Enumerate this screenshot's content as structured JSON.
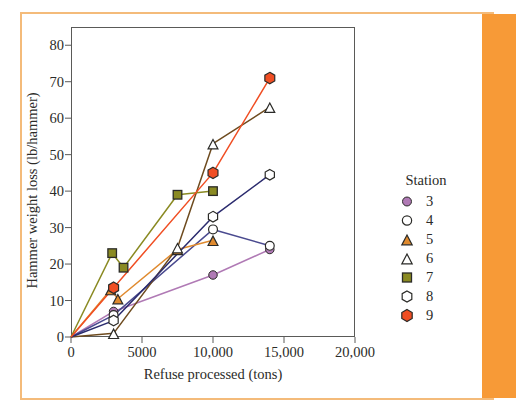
{
  "figure": {
    "xlabel": "Refuse processed (tons)",
    "ylabel": "Hammer weight loss (lb/hammer)",
    "legend_title": "Station"
  },
  "colors": {
    "band": "#f79a37",
    "frame_rule": "#f4bb7a",
    "axis": "#5a5a58",
    "station3": "#b07ab5",
    "station4": "#4a4a8f",
    "station5": "#e08a2e",
    "station6": "#6e4b1f",
    "station7": "#8a8a22",
    "station8": "#2b2b6e",
    "station9": "#f04e23"
  },
  "chart_data": {
    "type": "line",
    "title": "",
    "xlabel": "Refuse processed (tons)",
    "ylabel": "Hammer weight loss (lb/hammer)",
    "xlim": [
      0,
      20000
    ],
    "ylim": [
      0,
      85
    ],
    "xticks": [
      0,
      5000,
      10000,
      15000,
      20000
    ],
    "xtick_labels": [
      "0",
      "5000",
      "10,000",
      "15,000",
      "20,000"
    ],
    "yticks": [
      0,
      10,
      20,
      30,
      40,
      50,
      60,
      70,
      80
    ],
    "ytick_labels": [
      "0",
      "10",
      "20",
      "30",
      "40",
      "50",
      "60",
      "70",
      "80"
    ],
    "grid": false,
    "legend_position": "right",
    "legend_title": "Station",
    "series": [
      {
        "name": "3",
        "marker": "filled-circle",
        "color": "#b07ab5",
        "x": [
          0,
          3000,
          10000,
          14000
        ],
        "y": [
          0,
          7,
          17,
          24
        ]
      },
      {
        "name": "4",
        "marker": "open-circle",
        "color": "#4a4a8f",
        "x": [
          0,
          3000,
          10000,
          14000
        ],
        "y": [
          0,
          6,
          29.5,
          25
        ]
      },
      {
        "name": "5",
        "marker": "filled-triangle",
        "color": "#e08a2e",
        "x": [
          0,
          2800,
          3300,
          7500,
          10000
        ],
        "y": [
          0,
          13,
          10.5,
          24,
          26.5
        ]
      },
      {
        "name": "6",
        "marker": "open-triangle",
        "color": "#6e4b1f",
        "x": [
          0,
          3000,
          7500,
          10000,
          14000
        ],
        "y": [
          0,
          1,
          24.5,
          53,
          63
        ]
      },
      {
        "name": "7",
        "marker": "filled-square",
        "color": "#8a8a22",
        "x": [
          0,
          2900,
          3700,
          7500,
          10000
        ],
        "y": [
          0,
          23,
          19,
          39,
          40
        ]
      },
      {
        "name": "8",
        "marker": "open-hexagon",
        "color": "#2b2b6e",
        "x": [
          0,
          3000,
          10000,
          14000
        ],
        "y": [
          0,
          4.5,
          33,
          44.5
        ]
      },
      {
        "name": "9",
        "marker": "filled-hexagon",
        "color": "#f04e23",
        "x": [
          0,
          3000,
          10000,
          14000
        ],
        "y": [
          0,
          13.5,
          45,
          71
        ]
      }
    ]
  },
  "legend_items": [
    {
      "label": "3",
      "marker": "filled-circle",
      "color": "#b07ab5"
    },
    {
      "label": "4",
      "marker": "open-circle",
      "color": "#ffffff"
    },
    {
      "label": "5",
      "marker": "filled-triangle",
      "color": "#e08a2e"
    },
    {
      "label": "6",
      "marker": "open-triangle",
      "color": "#ffffff"
    },
    {
      "label": "7",
      "marker": "filled-square",
      "color": "#8a8a22"
    },
    {
      "label": "8",
      "marker": "open-hexagon",
      "color": "#ffffff"
    },
    {
      "label": "9",
      "marker": "filled-hexagon",
      "color": "#f04e23"
    }
  ]
}
